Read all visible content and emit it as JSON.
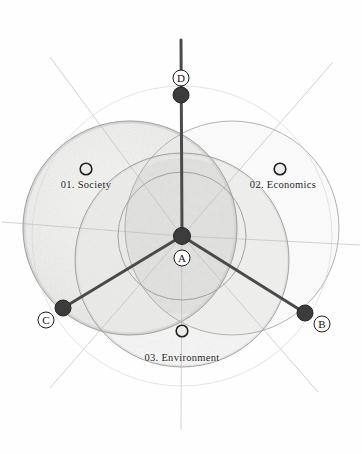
{
  "figure": {
    "background_color": "#fefefe",
    "accent_dark": "#3c3c3c",
    "line_color": "#555555",
    "hairline_color": "#b9b9b9",
    "shade_fill": "#f0f0ef"
  },
  "chart_data": {
    "type": "diagram",
    "title": "",
    "subtitle": "",
    "xlabel": "",
    "ylabel": "",
    "domains": [
      {
        "id": "01",
        "number": "01.",
        "name": "Society",
        "label": "01. Society",
        "marker": "open-circle",
        "marker_x": 86,
        "marker_y": 169,
        "label_x": 86,
        "label_y": 179,
        "circle_cx": 130,
        "circle_cy": 228,
        "circle_r": 107,
        "filled": true
      },
      {
        "id": "02",
        "number": "02.",
        "name": "Economics",
        "label": "02. Economics",
        "marker": "open-circle",
        "marker_x": 280,
        "marker_y": 169,
        "label_x": 283,
        "label_y": 179,
        "circle_cx": 232,
        "circle_cy": 228,
        "circle_r": 107,
        "filled": false
      },
      {
        "id": "03",
        "number": "03.",
        "name": "Environment",
        "label": "03. Environment",
        "marker": "open-circle",
        "marker_x": 182,
        "marker_y": 331,
        "label_x": 182,
        "label_y": 352,
        "circle_cx": 182,
        "circle_cy": 260,
        "circle_r": 107,
        "filled": false
      }
    ],
    "nodes": [
      {
        "id": "A",
        "letter": "A",
        "role": "hub",
        "x": 182,
        "y": 236,
        "dot_r": 8.5,
        "label_x": 182,
        "label_y": 258
      },
      {
        "id": "B",
        "letter": "B",
        "role": "endpoint",
        "x": 305,
        "y": 313,
        "dot_r": 8,
        "label_x": 322,
        "label_y": 324
      },
      {
        "id": "C",
        "letter": "C",
        "role": "endpoint",
        "x": 63,
        "y": 308,
        "dot_r": 8,
        "label_x": 46,
        "label_y": 320
      },
      {
        "id": "D",
        "letter": "D",
        "role": "endpoint",
        "x": 181,
        "y": 95,
        "dot_r": 8,
        "label_x": 181,
        "label_y": 78
      }
    ],
    "spokes": [
      {
        "from": "A",
        "to": "D",
        "x1": 182,
        "y1": 236,
        "x2": 181,
        "y2": 40,
        "width": 3.0
      },
      {
        "from": "A",
        "to": "B",
        "x1": 182,
        "y1": 236,
        "x2": 305,
        "y2": 313,
        "width": 3.0
      },
      {
        "from": "A",
        "to": "C",
        "x1": 182,
        "y1": 236,
        "x2": 63,
        "y2": 308,
        "width": 3.0
      }
    ],
    "hairlines": [
      {
        "x1": 182,
        "y1": 236,
        "x2": 50,
        "y2": 57
      },
      {
        "x1": 182,
        "y1": 236,
        "x2": 333,
        "y2": 62
      },
      {
        "x1": 182,
        "y1": 236,
        "x2": 50,
        "y2": 388
      },
      {
        "x1": 182,
        "y1": 236,
        "x2": 318,
        "y2": 392
      },
      {
        "x1": 182,
        "y1": 236,
        "x2": 2,
        "y2": 222
      },
      {
        "x1": 182,
        "y1": 236,
        "x2": 360,
        "y2": 245
      },
      {
        "x1": 182,
        "y1": 236,
        "x2": 181,
        "y2": 430
      }
    ],
    "extra_circles": [
      {
        "cx": 182,
        "cy": 236,
        "r": 64,
        "note": "small inner circle"
      },
      {
        "cx": 182,
        "cy": 236,
        "r": 150,
        "note": "large outer hairline circle"
      }
    ]
  }
}
